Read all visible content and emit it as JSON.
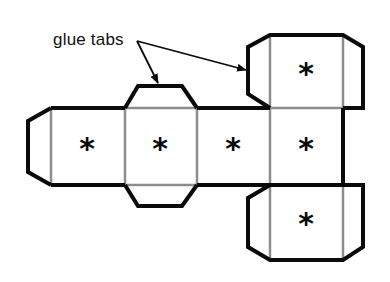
{
  "diagram": {
    "annotation": "glue tabs",
    "face_symbol": "*",
    "faces": [
      {
        "id": "face-1",
        "x": 87,
        "y": 147
      },
      {
        "id": "face-2",
        "x": 160,
        "y": 147
      },
      {
        "id": "face-3",
        "x": 233,
        "y": 147
      },
      {
        "id": "face-4",
        "x": 306,
        "y": 147
      },
      {
        "id": "face-top",
        "x": 306,
        "y": 72
      },
      {
        "id": "face-bottom",
        "x": 306,
        "y": 222
      }
    ],
    "colors": {
      "cut_line": "#0a0a0a",
      "fold_line": "#8c8c8c",
      "background": "#ffffff"
    }
  }
}
